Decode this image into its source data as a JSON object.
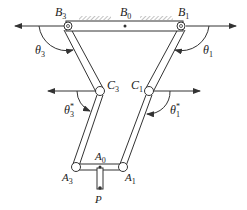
{
  "diagram": {
    "title": "",
    "colors": {
      "line": "#333333",
      "fill": "#ffffff",
      "hatch": "#888888"
    },
    "nodes": [
      {
        "id": "B3",
        "base": "B",
        "sub": "3",
        "x": 68,
        "y": 26
      },
      {
        "id": "B0",
        "base": "B",
        "sub": "0",
        "x": 125,
        "y": 26
      },
      {
        "id": "B1",
        "base": "B",
        "sub": "1",
        "x": 181,
        "y": 26
      },
      {
        "id": "C3",
        "base": "C",
        "sub": "3",
        "x": 100,
        "y": 91
      },
      {
        "id": "C1",
        "base": "C",
        "sub": "1",
        "x": 149,
        "y": 91
      },
      {
        "id": "A3",
        "base": "A",
        "sub": "3",
        "x": 76,
        "y": 167
      },
      {
        "id": "A0",
        "base": "A",
        "sub": "0",
        "x": 100,
        "y": 167
      },
      {
        "id": "A1",
        "base": "A",
        "sub": "1",
        "x": 123,
        "y": 167
      },
      {
        "id": "P",
        "base": "P",
        "sub": "",
        "x": 100,
        "y": 188
      }
    ],
    "links": [
      {
        "from": "B3",
        "to": "B1",
        "label": "fixed base link"
      },
      {
        "from": "B3",
        "to": "C3"
      },
      {
        "from": "C3",
        "to": "A3"
      },
      {
        "from": "B1",
        "to": "C1"
      },
      {
        "from": "C1",
        "to": "A1"
      },
      {
        "from": "A3",
        "to": "A1"
      },
      {
        "from": "A0",
        "to": "P"
      }
    ],
    "angles": [
      {
        "id": "theta3",
        "base": "θ",
        "sub": "3",
        "sup": ""
      },
      {
        "id": "theta1",
        "base": "θ",
        "sub": "1",
        "sup": ""
      },
      {
        "id": "theta3s",
        "base": "θ",
        "sub": "3",
        "sup": "*"
      },
      {
        "id": "theta1s",
        "base": "θ",
        "sub": "1",
        "sup": "*"
      }
    ],
    "labels": {
      "B3": {
        "base": "B",
        "sub": "3"
      },
      "B0": {
        "base": "B",
        "sub": "0"
      },
      "B1": {
        "base": "B",
        "sub": "1"
      },
      "C3": {
        "base": "C",
        "sub": "3"
      },
      "C1": {
        "base": "C",
        "sub": "1"
      },
      "A3": {
        "base": "A",
        "sub": "3"
      },
      "A0": {
        "base": "A",
        "sub": "0"
      },
      "A1": {
        "base": "A",
        "sub": "1"
      },
      "P": {
        "base": "P"
      },
      "theta3": {
        "base": "θ",
        "sub": "3"
      },
      "theta1": {
        "base": "θ",
        "sub": "1"
      },
      "theta3s": {
        "base": "θ",
        "sup": "*",
        "sub": "3"
      },
      "theta1s": {
        "base": "θ",
        "sup": "*",
        "sub": "1"
      }
    }
  }
}
